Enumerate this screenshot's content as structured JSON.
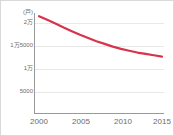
{
  "chart_data": {
    "type": "line",
    "title": "",
    "xlabel": "",
    "ylabel": "",
    "yunit": "(戸)",
    "xlim": [
      2000,
      2015
    ],
    "ylim": [
      0,
      22000
    ],
    "grid": true,
    "legend": false,
    "line_color": "#d8334a",
    "x": [
      2000,
      2001,
      2002,
      2003,
      2004,
      2005,
      2006,
      2007,
      2008,
      2009,
      2010,
      2011,
      2012,
      2013,
      2014,
      2015
    ],
    "values": [
      21300,
      20500,
      19700,
      18800,
      18000,
      17200,
      16500,
      15800,
      15200,
      14600,
      14100,
      13700,
      13300,
      13000,
      12700,
      12400
    ],
    "series": [
      {
        "name": "戸数",
        "values": [
          21300,
          20500,
          19700,
          18800,
          18000,
          17200,
          16500,
          15800,
          15200,
          14600,
          14100,
          13700,
          13300,
          13000,
          12700,
          12400
        ]
      }
    ],
    "ytick_values": [
      20000,
      15000,
      10000,
      5000
    ],
    "ytick_labels": [
      "2万",
      "1万5000",
      "1万",
      "5000"
    ],
    "xtick_values": [
      2000,
      2005,
      2010,
      2015
    ],
    "xtick_labels": [
      "2000",
      "2005",
      "2010",
      "2015"
    ]
  },
  "colors": {
    "line": "#d8334a",
    "grid": "#e8e8e8",
    "axis": "#9a9a9a",
    "tick_text": "#6b6b6b",
    "border": "#d9d9d9",
    "background": "#ffffff"
  }
}
